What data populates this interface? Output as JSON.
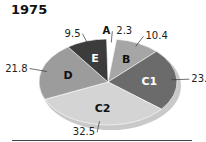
{
  "chart_data": {
    "type": "pie",
    "title": "1975",
    "categories": [
      "A",
      "B",
      "C1",
      "C2",
      "D",
      "E"
    ],
    "values": [
      2.3,
      10.4,
      23.5,
      32.5,
      21.8,
      9.5
    ],
    "colors": {
      "A": "#ffffff",
      "B": "#a6a6a6",
      "C1": "#6b6b6b",
      "C2": "#d4d4d4",
      "D": "#9c9c9c",
      "E": "#3c3c3c"
    },
    "style": "3d-tilted-ellipse",
    "value_labels": [
      "2.3",
      "10.4",
      "23.5",
      "32.5",
      "21.8",
      "9.5"
    ]
  }
}
